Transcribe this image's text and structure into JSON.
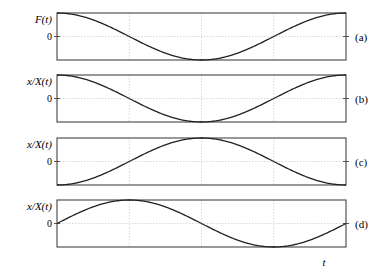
{
  "chart_data": [
    {
      "type": "line",
      "panel": "(a)",
      "ylabel": "F(t)",
      "yticks": [
        "0"
      ],
      "x": [
        0,
        0.25,
        0.5,
        0.75,
        1.0
      ],
      "function": "cos(2*pi*t)",
      "values": [
        1,
        0,
        -1,
        0,
        1
      ],
      "grid": true
    },
    {
      "type": "line",
      "panel": "(b)",
      "ylabel": "x/X(t)",
      "yticks": [
        "0"
      ],
      "x": [
        0,
        0.25,
        0.5,
        0.75,
        1.0
      ],
      "function": "cos(2*pi*t)",
      "values": [
        1,
        0,
        -1,
        0,
        1
      ],
      "grid": true
    },
    {
      "type": "line",
      "panel": "(c)",
      "ylabel": "x/X(t)",
      "yticks": [
        "0"
      ],
      "x": [
        0,
        0.25,
        0.5,
        0.75,
        1.0
      ],
      "function": "-cos(2*pi*t)",
      "values": [
        -1,
        0,
        1,
        0,
        -1
      ],
      "grid": true
    },
    {
      "type": "line",
      "panel": "(d)",
      "ylabel": "x/X(t)",
      "yticks": [
        "0"
      ],
      "x": [
        0,
        0.25,
        0.5,
        0.75,
        1.0
      ],
      "function": "sin(2*pi*t)",
      "values": [
        0,
        1,
        0,
        -1,
        0
      ],
      "xlabel": "t",
      "grid": true
    }
  ],
  "labels": {
    "a": {
      "ylabel": "F(t)",
      "zero": "0",
      "tag": "(a)"
    },
    "b": {
      "ylabel": "x/X(t)",
      "zero": "0",
      "tag": "(b)"
    },
    "c": {
      "ylabel": "x/X(t)",
      "zero": "0",
      "tag": "(c)"
    },
    "d": {
      "ylabel": "x/X(t)",
      "zero": "0",
      "tag": "(d)"
    },
    "xlabel": "t"
  }
}
